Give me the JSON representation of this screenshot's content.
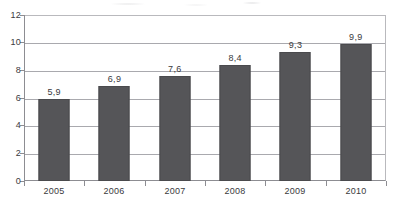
{
  "chart_data": {
    "type": "bar",
    "title": "",
    "subtitle": "",
    "xlabel": "",
    "ylabel": "",
    "categories": [
      "2005",
      "2006",
      "2007",
      "2008",
      "2009",
      "2010"
    ],
    "values": [
      5.9,
      6.9,
      7.6,
      8.4,
      9.3,
      9.9
    ],
    "value_labels": [
      "5,9",
      "6,9",
      "7,6",
      "8,4",
      "9,3",
      "9,9"
    ],
    "decimal_separator": ",",
    "series": [
      {
        "name": "",
        "values": [
          5.9,
          6.9,
          7.6,
          8.4,
          9.3,
          9.9
        ]
      }
    ],
    "ylim": [
      0,
      12
    ],
    "yticks": [
      0,
      2,
      4,
      6,
      8,
      10,
      12
    ],
    "ytick_labels": [
      "0",
      "2",
      "4",
      "6",
      "8",
      "10",
      "12"
    ],
    "grid": true,
    "grid_axis": "y",
    "legend": false,
    "legend_position": "none",
    "annotations": [],
    "colors": {
      "bar_fill": "#555558",
      "bar_border": "#4a4a4d",
      "gridline": "#a9a9ae",
      "axis_line": "#8d8d92",
      "plot_border": "#b9b9bd",
      "text": "#3a3a3d",
      "background": "#ffffff"
    }
  }
}
